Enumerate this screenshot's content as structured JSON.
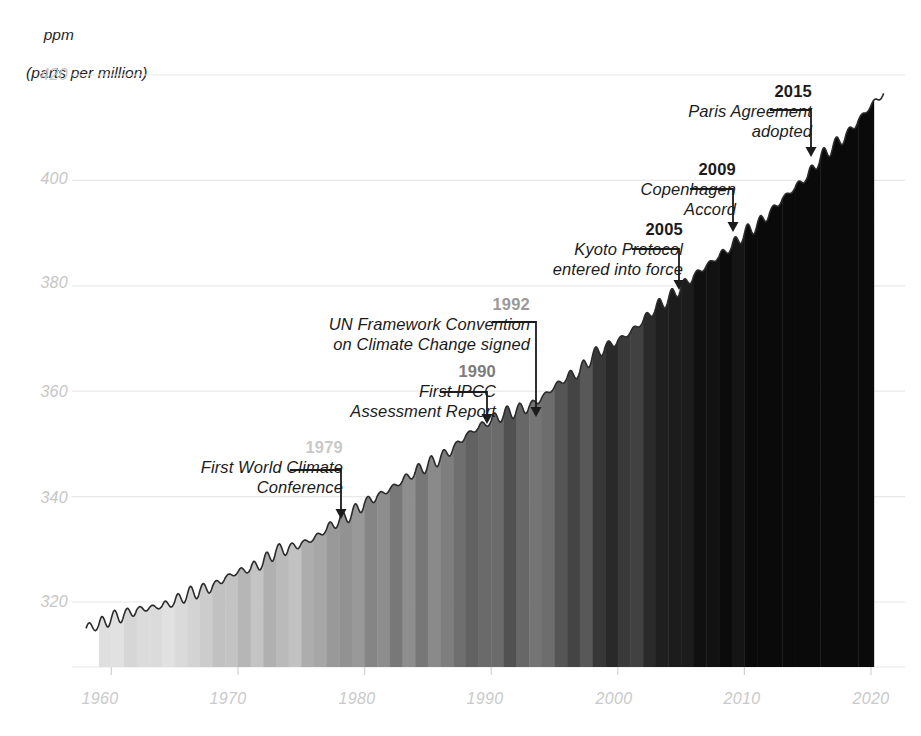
{
  "chart_data": {
    "type": "area",
    "title": "",
    "ylabel_line1": "ppm",
    "ylabel_line2": "(parts per million)",
    "xlabel": "",
    "xlim": [
      1958,
      2021.5
    ],
    "ylim": [
      312,
      423
    ],
    "grid": true,
    "legend": "none",
    "yticks": [
      "420",
      "400",
      "380",
      "360",
      "340",
      "320"
    ],
    "ytick_values": [
      420,
      400,
      380,
      360,
      340,
      320
    ],
    "xticks": [
      "1960",
      "1970",
      "1980",
      "1990",
      "2000",
      "2010",
      "2020"
    ],
    "xtick_values": [
      1960,
      1970,
      1980,
      1990,
      2000,
      2010,
      2020
    ],
    "series_name": "Atmospheric CO2 concentration",
    "x": [
      1958,
      1959,
      1960,
      1961,
      1962,
      1963,
      1964,
      1965,
      1966,
      1967,
      1968,
      1969,
      1970,
      1971,
      1972,
      1973,
      1974,
      1975,
      1976,
      1977,
      1978,
      1979,
      1980,
      1981,
      1982,
      1983,
      1984,
      1985,
      1986,
      1987,
      1988,
      1989,
      1990,
      1991,
      1992,
      1993,
      1994,
      1995,
      1996,
      1997,
      1998,
      1999,
      2000,
      2001,
      2002,
      2003,
      2004,
      2005,
      2006,
      2007,
      2008,
      2009,
      2010,
      2011,
      2012,
      2013,
      2014,
      2015,
      2016,
      2017,
      2018,
      2019,
      2020,
      2021
    ],
    "values": [
      315.0,
      315.6,
      316.9,
      317.6,
      318.5,
      318.9,
      319.2,
      320.0,
      321.4,
      322.2,
      323.0,
      324.6,
      325.7,
      326.3,
      327.5,
      329.7,
      330.2,
      331.1,
      332.0,
      333.8,
      335.4,
      336.8,
      338.8,
      340.1,
      341.4,
      343.0,
      344.6,
      346.0,
      347.4,
      349.2,
      351.6,
      353.1,
      354.4,
      355.6,
      356.4,
      357.1,
      358.8,
      360.8,
      362.6,
      363.7,
      366.7,
      368.4,
      369.6,
      371.2,
      373.3,
      375.8,
      377.5,
      379.8,
      381.9,
      383.8,
      385.6,
      387.4,
      389.9,
      391.6,
      393.9,
      396.5,
      398.6,
      400.8,
      404.2,
      406.5,
      408.5,
      411.4,
      414.2,
      416.5
    ],
    "stripes_note": "grayscale warming stripes under curve, 1959-2020",
    "annotations": [
      {
        "year": "1979",
        "label_lines": [
          "First World Climate",
          "Conference"
        ],
        "year_color": "#c9c9c9",
        "point_year": 1979,
        "point_value": 336.8
      },
      {
        "year": "1990",
        "label_lines": [
          "First IPCC",
          "Assessment Report"
        ],
        "year_color": "#7d7d7d",
        "point_year": 1990,
        "point_value": 354.4
      },
      {
        "year": "1992",
        "label_lines": [
          "UN Framework Convention",
          "on Climate Change signed"
        ],
        "year_color": "#9a9a9a",
        "point_year": 1992,
        "point_value": 356.4
      },
      {
        "year": "2005",
        "label_lines": [
          "Kyoto Protocol",
          "entered into force"
        ],
        "year_color": "#1b1b1b",
        "point_year": 2005,
        "point_value": 379.8
      },
      {
        "year": "2009",
        "label_lines": [
          "Copenhagen",
          "Accord"
        ],
        "year_color": "#1b1b1b",
        "point_year": 2009,
        "point_value": 387.4
      },
      {
        "year": "2015",
        "label_lines": [
          "Paris Agreement",
          "adopted"
        ],
        "year_color": "#1b1b1b",
        "point_year": 2015,
        "point_value": 400.8
      }
    ],
    "colors": {
      "line": "#2b2b2b",
      "gridline": "#e8e8e8",
      "tick_label": "#c9c9c9",
      "axis_title": "#1f1f1f",
      "leader": "#1b1b1b"
    }
  }
}
